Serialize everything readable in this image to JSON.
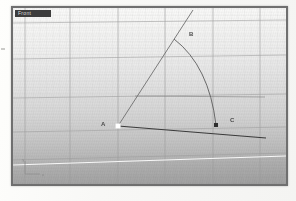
{
  "viewport": {
    "title": "Front",
    "background_top": "#fbfbfa",
    "background_bottom": "#a8a8a8",
    "grid_color": "#9a9a9a",
    "grid_minor_color": "#c9c9c9",
    "frame_color": "#6f6f6f"
  },
  "axis_gizmo": {
    "name": "world-axes-icon",
    "x_label": "x",
    "y_label": "y"
  },
  "points": [
    {
      "id": "A",
      "label": "A",
      "x": 105,
      "y": 118,
      "marker": "white-square",
      "label_dx": -12,
      "label_dy": -2
    },
    {
      "id": "B",
      "label": "B",
      "x": 161,
      "y": 31,
      "marker": "none",
      "label_dx": 14,
      "label_dy": -3
    },
    {
      "id": "C",
      "label": "C",
      "x": 203,
      "y": 117,
      "marker": "dark-square",
      "label_dx": 14,
      "label_dy": -4
    }
  ],
  "geometry": {
    "ray_ab": {
      "name": "line-a-to-b-extended",
      "x1": 105,
      "y1": 118,
      "x2": 179,
      "y2": 4,
      "color": "#6e6e6e"
    },
    "line_ac": {
      "name": "line-a-to-c-extended",
      "x1": 105,
      "y1": 118,
      "x2": 252,
      "y2": 129,
      "color": "#3c3c3c"
    },
    "arc_bc": {
      "name": "arc-b-to-c",
      "start_x": 161,
      "start_y": 31,
      "end_x": 203,
      "end_y": 117,
      "radius": 92,
      "color": "#5c5c5c"
    },
    "construction_line": {
      "name": "horizontal-construction-line",
      "x1": 122,
      "y1": 88,
      "x2": 252,
      "y2": 89,
      "color": "#7c7c7c"
    },
    "ground_line": {
      "name": "ground-horizon-line",
      "x1": 0,
      "y1": 157,
      "x2": 273,
      "y2": 148,
      "color": "#fdfdfd"
    }
  },
  "grid": {
    "vertical_major_x": [
      12,
      57,
      105,
      152,
      200,
      247
    ],
    "horizontal_major_y": [
      14,
      50,
      88,
      122,
      150
    ],
    "vertical_minor_count": 40,
    "horizontal_minor_count": 22
  },
  "colors": {
    "point_a_marker": "#ffffff",
    "point_c_marker": "#2e2e2e",
    "label_text": "#4a4a4a",
    "title_bg": "#3d3d3d",
    "title_text": "#dcdcdc"
  }
}
